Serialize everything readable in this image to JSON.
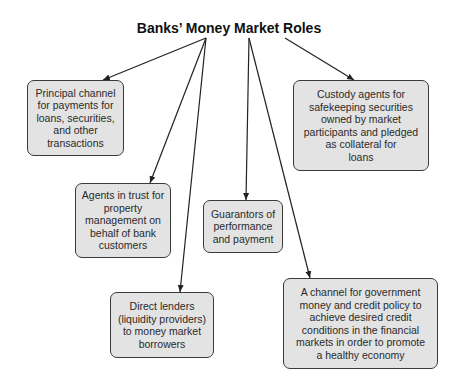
{
  "diagram": {
    "title": "Banks’ Money Market Roles",
    "nodes": [
      {
        "id": "payments",
        "text": "Principal channel\nfor payments for\nloans, securities,\nand other\ntransactions"
      },
      {
        "id": "custody",
        "text": "Custody agents for\nsafekeeping securities\nowned by market\nparticipants and pledged\nas collateral for\nloans"
      },
      {
        "id": "trust",
        "text": "Agents in trust for\nproperty\nmanagement on\nbehalf of bank\ncustomers"
      },
      {
        "id": "guarantors",
        "text": "Guarantors of\nperformance\nand payment"
      },
      {
        "id": "lenders",
        "text": "Direct lenders\n(liquidity providers)\nto money market\nborrowers"
      },
      {
        "id": "policy",
        "text": "A channel for government\nmoney and credit policy to\nachieve desired credit\nconditions in the financial\nmarkets in order to promote\na healthy economy"
      }
    ],
    "edges": [
      {
        "from": "title",
        "to": "payments"
      },
      {
        "from": "title",
        "to": "trust"
      },
      {
        "from": "title",
        "to": "lenders"
      },
      {
        "from": "title",
        "to": "guarantors"
      },
      {
        "from": "title",
        "to": "policy"
      },
      {
        "from": "title",
        "to": "custody"
      }
    ]
  }
}
